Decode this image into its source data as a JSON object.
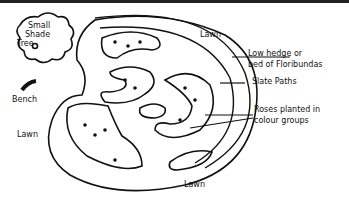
{
  "diagram": {
    "type": "garden-plan",
    "labels": {
      "tree": [
        "Small",
        "Shade",
        "Tree"
      ],
      "bench": "Bench",
      "lawn_top": "Lawn",
      "lawn_left": "Lawn",
      "lawn_bottom": "Lawn",
      "hedge": [
        "Low hedge or",
        "bed of Floribundas"
      ],
      "paths": "Slate Paths",
      "roses": [
        "Roses planted in",
        "colour groups"
      ]
    },
    "colors": {
      "ink": "#111111",
      "paper": "#ffffff"
    }
  }
}
